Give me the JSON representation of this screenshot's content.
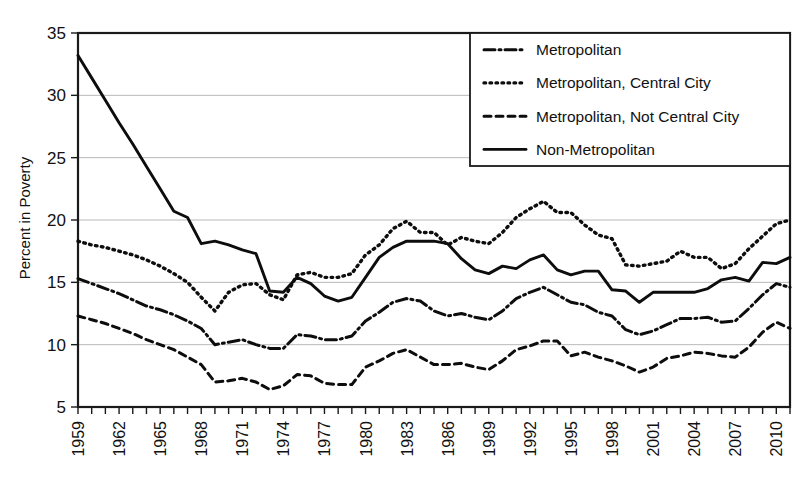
{
  "chart_data": {
    "type": "line",
    "title": "",
    "xlabel": "",
    "ylabel": "Percent in Poverty",
    "ylim": [
      5,
      35
    ],
    "ytick_values": [
      5,
      10,
      15,
      20,
      25,
      30,
      35
    ],
    "ytick_labels": [
      "5",
      "10",
      "15",
      "20",
      "25",
      "30",
      "35"
    ],
    "grid": true,
    "grid_axis": "y",
    "legend_position": "top-right",
    "x_start": 1959,
    "x_end": 2011,
    "xlim": [
      1959,
      2011
    ],
    "xtick_labels": [
      "1959",
      "1962",
      "1965",
      "1968",
      "1971",
      "1974",
      "1977",
      "1980",
      "1983",
      "1986",
      "1989",
      "1992",
      "1995",
      "1998",
      "2001",
      "2004",
      "2007",
      "2010"
    ],
    "xtick_values": [
      1959,
      1962,
      1965,
      1968,
      1971,
      1974,
      1977,
      1980,
      1983,
      1986,
      1989,
      1992,
      1995,
      1998,
      2001,
      2004,
      2007,
      2010
    ],
    "x": [
      1959,
      1960,
      1961,
      1962,
      1963,
      1964,
      1965,
      1966,
      1967,
      1968,
      1969,
      1970,
      1971,
      1972,
      1973,
      1974,
      1975,
      1976,
      1977,
      1978,
      1979,
      1980,
      1981,
      1982,
      1983,
      1984,
      1985,
      1986,
      1987,
      1988,
      1989,
      1990,
      1991,
      1992,
      1993,
      1994,
      1995,
      1996,
      1997,
      1998,
      1999,
      2000,
      2001,
      2002,
      2003,
      2004,
      2005,
      2006,
      2007,
      2008,
      2009,
      2010,
      2011
    ],
    "series": [
      {
        "name": "Metropolitan",
        "line_style": "dashdot",
        "color": "#0d0d0d",
        "values": [
          15.3,
          14.9,
          14.5,
          14.1,
          13.6,
          13.1,
          12.8,
          12.4,
          11.9,
          11.3,
          10.0,
          10.2,
          10.4,
          10.0,
          9.7,
          9.7,
          10.8,
          10.7,
          10.4,
          10.4,
          10.7,
          11.9,
          12.6,
          13.4,
          13.7,
          13.5,
          12.7,
          12.3,
          12.5,
          12.2,
          12.0,
          12.7,
          13.7,
          14.2,
          14.6,
          14.0,
          13.4,
          13.2,
          12.6,
          12.3,
          11.2,
          10.8,
          11.1,
          11.6,
          12.1,
          12.1,
          12.2,
          11.8,
          11.9,
          12.9,
          14.0,
          14.9,
          14.6
        ]
      },
      {
        "name": "Metropolitan, Central City",
        "line_style": "dotted",
        "color": "#0d0d0d",
        "values": [
          18.3,
          18.0,
          17.8,
          17.5,
          17.2,
          16.8,
          16.3,
          15.7,
          15.0,
          13.8,
          12.7,
          14.2,
          14.8,
          14.9,
          14.0,
          13.6,
          15.6,
          15.8,
          15.4,
          15.4,
          15.7,
          17.2,
          18.0,
          19.3,
          19.9,
          19.0,
          19.0,
          18.0,
          18.6,
          18.3,
          18.1,
          19.0,
          20.2,
          20.9,
          21.5,
          20.6,
          20.6,
          19.6,
          18.8,
          18.5,
          16.4,
          16.3,
          16.5,
          16.7,
          17.5,
          17.0,
          17.0,
          16.1,
          16.5,
          17.7,
          18.7,
          19.7,
          20.0
        ]
      },
      {
        "name": "Metropolitan, Not Central City",
        "line_style": "dashed",
        "color": "#0d0d0d",
        "values": [
          12.3,
          12.0,
          11.7,
          11.3,
          10.9,
          10.4,
          10.0,
          9.6,
          9.0,
          8.4,
          7.0,
          7.1,
          7.3,
          7.0,
          6.4,
          6.7,
          7.6,
          7.5,
          6.9,
          6.8,
          6.8,
          8.2,
          8.7,
          9.3,
          9.6,
          9.0,
          8.4,
          8.4,
          8.5,
          8.2,
          8.0,
          8.7,
          9.6,
          9.9,
          10.3,
          10.3,
          9.1,
          9.4,
          9.0,
          8.7,
          8.3,
          7.8,
          8.2,
          8.9,
          9.1,
          9.4,
          9.3,
          9.1,
          9.0,
          9.8,
          11.0,
          11.8,
          11.3
        ]
      },
      {
        "name": "Non-Metropolitan",
        "line_style": "solid",
        "color": "#0d0d0d",
        "values": [
          33.2,
          31.4,
          29.6,
          27.8,
          26.1,
          24.3,
          22.5,
          20.7,
          20.2,
          18.1,
          18.3,
          18.0,
          17.6,
          17.3,
          14.3,
          14.2,
          15.4,
          14.9,
          13.9,
          13.5,
          13.8,
          15.4,
          17.0,
          17.8,
          18.3,
          18.3,
          18.3,
          18.1,
          16.9,
          16.0,
          15.7,
          16.3,
          16.1,
          16.8,
          17.2,
          16.0,
          15.6,
          15.9,
          15.9,
          14.4,
          14.3,
          13.4,
          14.2,
          14.2,
          14.2,
          14.2,
          14.5,
          15.2,
          15.4,
          15.1,
          16.6,
          16.5,
          17.0
        ]
      }
    ]
  }
}
